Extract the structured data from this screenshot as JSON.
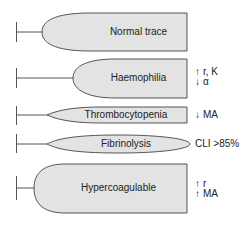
{
  "colors": {
    "fill": "#e3e3e3",
    "stroke": "#555555",
    "text": "#222222"
  },
  "traces": [
    {
      "label": "Normal trace",
      "note_lines": []
    },
    {
      "label": "Haemophilia",
      "note_lines": [
        {
          "arrow": "↑",
          "text": "r, K"
        },
        {
          "arrow": "↓",
          "text": "α"
        }
      ]
    },
    {
      "label": "Thrombocytopenia",
      "note_lines": [
        {
          "arrow": "↓",
          "text": "MA"
        }
      ]
    },
    {
      "label": "Fibrinolysis",
      "note_lines": [
        {
          "arrow": "",
          "text": "CLI >85%"
        }
      ]
    },
    {
      "label": "Hypercoagulable",
      "note_lines": [
        {
          "arrow": "↑",
          "text": "r"
        },
        {
          "arrow": "↑",
          "text": "MA"
        }
      ]
    }
  ]
}
